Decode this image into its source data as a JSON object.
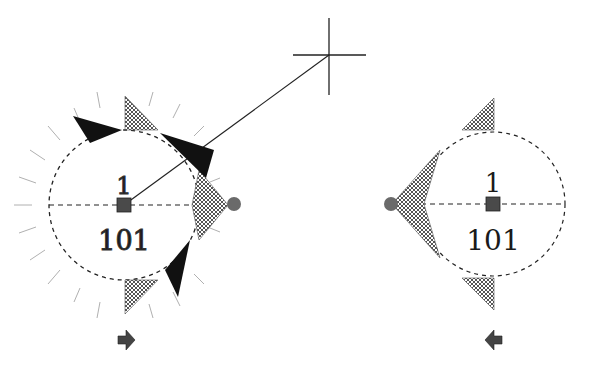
{
  "diagram": {
    "left_node": {
      "top_label": "1",
      "bottom_label": "101",
      "center": [
        124,
        205
      ],
      "radius": 75,
      "direction_arrow": "right",
      "state": "selected"
    },
    "right_node": {
      "top_label": "1",
      "bottom_label": "101",
      "center": [
        493,
        204
      ],
      "radius": 72,
      "direction_arrow": "left",
      "state": "normal"
    },
    "crosshair": {
      "center": [
        329,
        55
      ],
      "size": 36
    },
    "connector": {
      "from": "left-node-center",
      "to": "crosshair"
    },
    "colors": {
      "stroke": "#222222",
      "hatch": "#555555",
      "fill_dark": "#111111",
      "handle": "#6a6a6a",
      "tick": "#b0b0b0"
    }
  }
}
